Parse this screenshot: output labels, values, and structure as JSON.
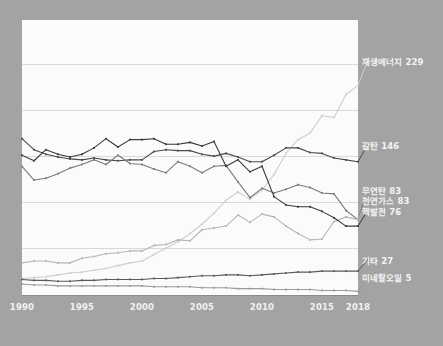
{
  "chart_data": {
    "type": "line",
    "title": "",
    "xlabel": "",
    "ylabel": "",
    "xlim": [
      1990,
      2018
    ],
    "ylim": [
      0,
      300
    ],
    "grid": true,
    "gridlines": [
      50,
      100,
      150,
      200,
      250
    ],
    "legend_position": "right-inline-end-labels",
    "x": [
      1990,
      1991,
      1992,
      1993,
      1994,
      1995,
      1996,
      1997,
      1998,
      1999,
      2000,
      2001,
      2002,
      2003,
      2004,
      2005,
      2006,
      2007,
      2008,
      2009,
      2010,
      2011,
      2012,
      2013,
      2014,
      2015,
      2016,
      2017,
      2018
    ],
    "tick_labels": [
      "1990",
      "1995",
      "2000",
      "2005",
      "2010",
      "2015",
      "2018"
    ],
    "tick_values": [
      1990,
      1995,
      2000,
      2005,
      2010,
      2015,
      2018
    ],
    "series": [
      {
        "name": "재생에너지",
        "label": "재생에너지 229",
        "end_value": 229,
        "color": "#cfcfcf",
        "values": [
          19,
          20,
          21,
          23,
          25,
          26,
          28,
          30,
          33,
          36,
          38,
          45,
          52,
          59,
          68,
          78,
          90,
          104,
          113,
          105,
          115,
          132,
          155,
          170,
          177,
          196,
          194,
          219,
          229
        ]
      },
      {
        "name": "갈탄",
        "label": "갈탄 146",
        "end_value": 146,
        "color": "#4a4a4a",
        "values": [
          171,
          159,
          154,
          151,
          149,
          148,
          150,
          148,
          147,
          148,
          148,
          157,
          159,
          158,
          158,
          154,
          152,
          155,
          151,
          146,
          146,
          153,
          161,
          161,
          156,
          155,
          150,
          148,
          146
        ]
      },
      {
        "name": "무연탄",
        "label": "무연탄 83",
        "end_value": 83,
        "color": "#7a7a7a",
        "values": [
          141,
          126,
          128,
          133,
          139,
          143,
          148,
          143,
          153,
          144,
          143,
          138,
          134,
          146,
          141,
          134,
          141,
          142,
          124,
          107,
          117,
          112,
          116,
          121,
          118,
          112,
          111,
          93,
          83
        ]
      },
      {
        "name": "천연가스",
        "label": "천연가스 83",
        "end_value": 83,
        "color": "#b5b5b5",
        "values": [
          36,
          38,
          38,
          36,
          36,
          41,
          43,
          46,
          47,
          49,
          49,
          55,
          56,
          61,
          60,
          72,
          74,
          76,
          88,
          80,
          89,
          86,
          76,
          68,
          61,
          62,
          81,
          86,
          83
        ]
      },
      {
        "name": "핵발전",
        "label": "핵발전 76",
        "end_value": 76,
        "color": "#3a3a3a",
        "values": [
          153,
          147,
          159,
          154,
          151,
          154,
          161,
          171,
          162,
          170,
          170,
          171,
          165,
          165,
          167,
          163,
          168,
          141,
          148,
          135,
          141,
          108,
          99,
          97,
          97,
          92,
          85,
          76,
          76
        ]
      },
      {
        "name": "기타",
        "label": "기타 27",
        "end_value": 27,
        "color": "#5a5a5a",
        "values": [
          18,
          17,
          17,
          16,
          16,
          17,
          17,
          18,
          18,
          18,
          18,
          19,
          19,
          20,
          21,
          22,
          22,
          23,
          23,
          22,
          23,
          24,
          25,
          26,
          26,
          27,
          27,
          27,
          27
        ]
      },
      {
        "name": "미네랄오일",
        "label": "미네랄오일 5",
        "end_value": 5,
        "color": "#9b9b9b",
        "values": [
          13,
          12,
          12,
          11,
          11,
          11,
          11,
          11,
          11,
          11,
          11,
          10,
          10,
          10,
          10,
          9,
          9,
          9,
          8,
          8,
          8,
          7,
          7,
          7,
          7,
          6,
          6,
          6,
          5
        ]
      }
    ],
    "label_positions": [
      {
        "series": "재생에너지",
        "top": 55
      },
      {
        "series": "갈탄",
        "top": 139
      },
      {
        "series": "무연탄",
        "top": 184
      },
      {
        "series": "천연가스",
        "top": 194
      },
      {
        "series": "핵발전",
        "top": 205
      },
      {
        "series": "기타",
        "top": 254
      },
      {
        "series": "미네랄오일",
        "top": 271
      }
    ],
    "colors": {
      "background": "#a3a3a3",
      "panel": "#fbfbfb",
      "grid": "#d9d9d9",
      "axis": "#8c8c8c",
      "text": "#f4f4f4"
    }
  }
}
